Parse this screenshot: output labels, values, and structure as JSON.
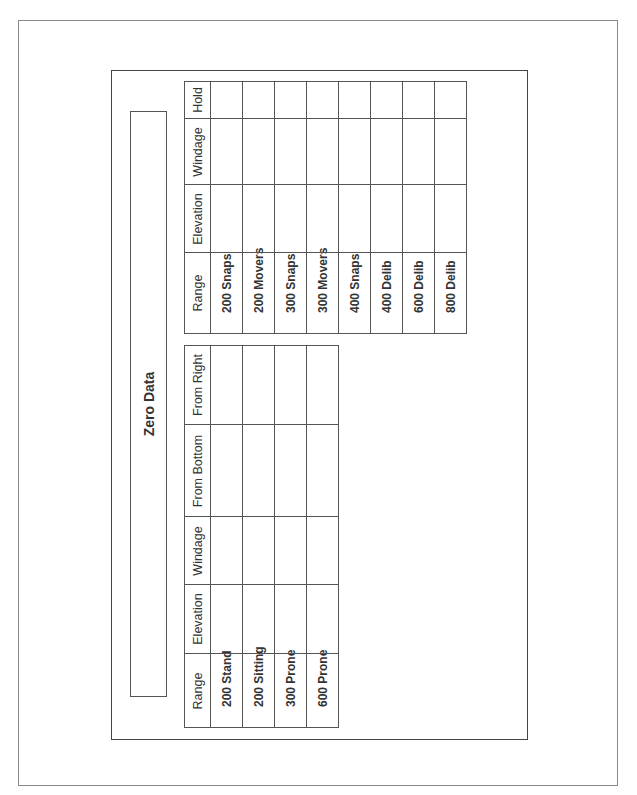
{
  "document": {
    "title": "Zero Data",
    "tables": [
      {
        "name": "zero-table",
        "headers": [
          "Range",
          "Elevation",
          "Windage",
          "From Bottom",
          "From Right"
        ],
        "rows": [
          [
            "200 Stand",
            "",
            "",
            "",
            ""
          ],
          [
            "200 Sitting",
            "",
            "",
            "",
            ""
          ],
          [
            "300 Prone",
            "",
            "",
            "",
            ""
          ],
          [
            "600 Prone",
            "",
            "",
            "",
            ""
          ]
        ]
      },
      {
        "name": "hold-table",
        "headers": [
          "Range",
          "Elevation",
          "Windage",
          "Hold"
        ],
        "rows": [
          [
            "200 Snaps",
            "",
            "",
            ""
          ],
          [
            "200 Movers",
            "",
            "",
            ""
          ],
          [
            "300 Snaps",
            "",
            "",
            ""
          ],
          [
            "300 Movers",
            "",
            "",
            ""
          ],
          [
            "400 Snaps",
            "",
            "",
            ""
          ],
          [
            "400 Delib",
            "",
            "",
            ""
          ],
          [
            "600 Delib",
            "",
            "",
            ""
          ],
          [
            "800 Delib",
            "",
            "",
            ""
          ]
        ]
      }
    ]
  }
}
